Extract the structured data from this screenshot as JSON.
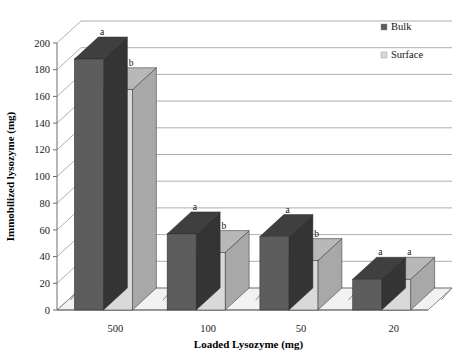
{
  "chart_data": {
    "type": "bar",
    "title": "",
    "subtitle": "",
    "xlabel": "Loaded Lysozyme (mg)",
    "ylabel": "Immobilized lysozyme (mg)",
    "categories": [
      "500",
      "100",
      "50",
      "20"
    ],
    "ylim": [
      0,
      200
    ],
    "ytick_step": 20,
    "yticks": [
      "0",
      "20",
      "40",
      "60",
      "80",
      "100",
      "120",
      "140",
      "160",
      "180",
      "200"
    ],
    "grid": true,
    "grid_axis": "y",
    "legend_position": "top-right",
    "three_d": true,
    "series": [
      {
        "name": "Bulk",
        "color": "#5d5d5d",
        "values": [
          188,
          57,
          55,
          23
        ],
        "annotations": [
          "a",
          "a",
          "a",
          "a"
        ]
      },
      {
        "name": "Surface",
        "color": "#d9d9d9",
        "values": [
          165,
          43,
          37,
          23
        ],
        "annotations": [
          "b",
          "b",
          "b",
          "a"
        ]
      }
    ]
  },
  "legend": {
    "items": [
      {
        "label": "Bulk",
        "swatch_color": "#5d5d5d"
      },
      {
        "label": "Surface",
        "swatch_color": "#d9d9d9"
      }
    ]
  },
  "axes": {
    "x_title": "Loaded Lysozyme (mg)",
    "y_title": "Immobilized lysozyme (mg)"
  },
  "colors": {
    "bulk": "#5d5d5d",
    "bulk_top": "#3f3f3f",
    "bulk_side": "#343434",
    "surface": "#d9d9d9",
    "surface_top": "#b8b8b8",
    "surface_side": "#a8a8a8",
    "gridline": "#9a9a9a",
    "axis": "#6e6e6e",
    "floor": "#f2f2f2",
    "text": "#111111"
  }
}
